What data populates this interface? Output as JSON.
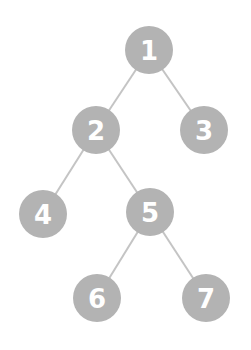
{
  "diagram": {
    "type": "binary-tree",
    "colors": {
      "node_fill": "#b3b3b3",
      "node_text": "#ffffff",
      "edge": "#c4c4c4",
      "background": "#ffffff"
    },
    "node_radius": 24,
    "nodes": [
      {
        "id": "1",
        "label": "1",
        "x": 149,
        "y": 50
      },
      {
        "id": "2",
        "label": "2",
        "x": 96,
        "y": 130
      },
      {
        "id": "3",
        "label": "3",
        "x": 204,
        "y": 130
      },
      {
        "id": "4",
        "label": "4",
        "x": 43,
        "y": 214
      },
      {
        "id": "5",
        "label": "5",
        "x": 150,
        "y": 212
      },
      {
        "id": "6",
        "label": "6",
        "x": 97,
        "y": 298
      },
      {
        "id": "7",
        "label": "7",
        "x": 206,
        "y": 298
      }
    ],
    "edges": [
      {
        "from": "1",
        "to": "2"
      },
      {
        "from": "1",
        "to": "3"
      },
      {
        "from": "2",
        "to": "4"
      },
      {
        "from": "2",
        "to": "5"
      },
      {
        "from": "5",
        "to": "6"
      },
      {
        "from": "5",
        "to": "7"
      }
    ]
  }
}
